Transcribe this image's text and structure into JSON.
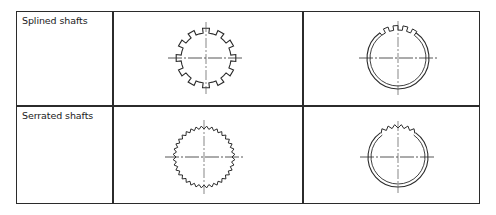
{
  "table": {
    "rows": [
      {
        "label": "Splined shafts",
        "shaft_figure": {
          "type": "splined-shaft",
          "teeth": 12,
          "tooth_shape": "square"
        },
        "hub_figure": {
          "type": "splined-hub",
          "visible_teeth": 4,
          "tooth_shape": "square"
        }
      },
      {
        "label": "Serrated shafts",
        "shaft_figure": {
          "type": "serrated-shaft",
          "teeth": 36,
          "tooth_shape": "triangular"
        },
        "hub_figure": {
          "type": "serrated-hub",
          "visible_teeth": 6,
          "tooth_shape": "triangular"
        }
      }
    ]
  },
  "colors": {
    "line": "#2b2b2b",
    "centerline": "#555555",
    "background": "#ffffff"
  }
}
